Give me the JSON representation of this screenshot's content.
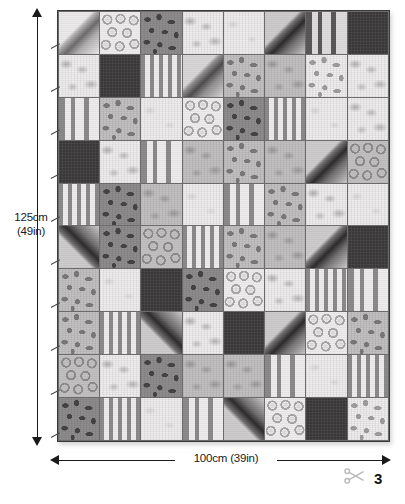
{
  "figure": {
    "page_number": "3",
    "scissors_icon": "scissors-icon"
  },
  "dimensions": {
    "height_label": "125cm",
    "height_label_sub": "(49in)",
    "width_label": "100cm (39in)",
    "vertical_arrow": "double-headed-vertical-arrow",
    "horizontal_arrow": "double-headed-horizontal-arrow"
  },
  "quilt": {
    "columns": 8,
    "rows": 10,
    "patch_total": 80,
    "patterns_legend": [
      "diagonal",
      "circles",
      "spots",
      "plain",
      "stripes",
      "dark",
      "mottle"
    ],
    "colors": {
      "ink": "#1a1a1a",
      "seam": "#585858",
      "border": "#3a3a3a",
      "light": "#f0eeee",
      "mid": "#b5b3b3",
      "dark": "#3b3939",
      "page_bg": "#ffffff"
    },
    "patches": [
      [
        {
          "pattern": "diagonal",
          "tone": "light"
        },
        {
          "pattern": "circles",
          "tone": "light"
        },
        {
          "pattern": "spots",
          "tone": "dark"
        },
        {
          "pattern": "mottle",
          "tone": "light"
        },
        {
          "pattern": "plain",
          "tone": "light"
        },
        {
          "pattern": "diagonal",
          "tone": "dark"
        },
        {
          "pattern": "stripes-wide",
          "tone": "dark"
        },
        {
          "pattern": "dark",
          "tone": "dark"
        }
      ],
      [
        {
          "pattern": "mottle",
          "tone": "light"
        },
        {
          "pattern": "dark",
          "tone": "dark"
        },
        {
          "pattern": "stripes",
          "tone": "mid"
        },
        {
          "pattern": "diagonal",
          "tone": "mid"
        },
        {
          "pattern": "spots",
          "tone": "mid"
        },
        {
          "pattern": "mottle",
          "tone": "mid"
        },
        {
          "pattern": "spots",
          "tone": "light"
        },
        {
          "pattern": "mottle",
          "tone": "light"
        }
      ],
      [
        {
          "pattern": "stripes-wide",
          "tone": "mid"
        },
        {
          "pattern": "spots",
          "tone": "mid"
        },
        {
          "pattern": "plain",
          "tone": "light"
        },
        {
          "pattern": "circles",
          "tone": "light"
        },
        {
          "pattern": "spots",
          "tone": "dark"
        },
        {
          "pattern": "stripes",
          "tone": "mid"
        },
        {
          "pattern": "plain",
          "tone": "light"
        },
        {
          "pattern": "mottle",
          "tone": "light"
        }
      ],
      [
        {
          "pattern": "dark",
          "tone": "dark"
        },
        {
          "pattern": "mottle",
          "tone": "light"
        },
        {
          "pattern": "stripes-wide",
          "tone": "mid"
        },
        {
          "pattern": "mottle",
          "tone": "mid"
        },
        {
          "pattern": "spots",
          "tone": "mid"
        },
        {
          "pattern": "mottle",
          "tone": "mid"
        },
        {
          "pattern": "diagonal",
          "tone": "dark"
        },
        {
          "pattern": "circles",
          "tone": "mid"
        }
      ],
      [
        {
          "pattern": "stripes",
          "tone": "mid"
        },
        {
          "pattern": "spots",
          "tone": "dark"
        },
        {
          "pattern": "mottle",
          "tone": "mid"
        },
        {
          "pattern": "plain",
          "tone": "light"
        },
        {
          "pattern": "stripes-wide",
          "tone": "mid"
        },
        {
          "pattern": "spots",
          "tone": "mid"
        },
        {
          "pattern": "mottle",
          "tone": "light"
        },
        {
          "pattern": "plain",
          "tone": "light"
        }
      ],
      [
        {
          "pattern": "diagonal-rev",
          "tone": "dark"
        },
        {
          "pattern": "spots",
          "tone": "dark"
        },
        {
          "pattern": "circles",
          "tone": "mid"
        },
        {
          "pattern": "stripes",
          "tone": "mid"
        },
        {
          "pattern": "spots",
          "tone": "mid"
        },
        {
          "pattern": "mottle",
          "tone": "mid"
        },
        {
          "pattern": "diagonal",
          "tone": "dark"
        },
        {
          "pattern": "dark",
          "tone": "dark"
        }
      ],
      [
        {
          "pattern": "spots",
          "tone": "mid"
        },
        {
          "pattern": "plain",
          "tone": "light"
        },
        {
          "pattern": "dark",
          "tone": "dark"
        },
        {
          "pattern": "spots",
          "tone": "dark"
        },
        {
          "pattern": "circles",
          "tone": "light"
        },
        {
          "pattern": "mottle",
          "tone": "light"
        },
        {
          "pattern": "stripes",
          "tone": "mid"
        },
        {
          "pattern": "stripes-wide",
          "tone": "mid"
        }
      ],
      [
        {
          "pattern": "spots",
          "tone": "mid"
        },
        {
          "pattern": "stripes",
          "tone": "mid"
        },
        {
          "pattern": "diagonal-rev",
          "tone": "dark"
        },
        {
          "pattern": "mottle",
          "tone": "light"
        },
        {
          "pattern": "dark",
          "tone": "dark"
        },
        {
          "pattern": "diagonal",
          "tone": "dark"
        },
        {
          "pattern": "circles",
          "tone": "light"
        },
        {
          "pattern": "spots",
          "tone": "mid"
        }
      ],
      [
        {
          "pattern": "circles",
          "tone": "mid"
        },
        {
          "pattern": "mottle",
          "tone": "light"
        },
        {
          "pattern": "spots",
          "tone": "dark"
        },
        {
          "pattern": "mottle",
          "tone": "mid"
        },
        {
          "pattern": "mottle",
          "tone": "mid"
        },
        {
          "pattern": "stripes-wide",
          "tone": "mid"
        },
        {
          "pattern": "plain",
          "tone": "light"
        },
        {
          "pattern": "stripes",
          "tone": "mid"
        }
      ],
      [
        {
          "pattern": "spots",
          "tone": "dark"
        },
        {
          "pattern": "stripes",
          "tone": "mid"
        },
        {
          "pattern": "plain",
          "tone": "light"
        },
        {
          "pattern": "stripes-wide",
          "tone": "mid"
        },
        {
          "pattern": "diagonal-rev",
          "tone": "dark"
        },
        {
          "pattern": "circles",
          "tone": "light"
        },
        {
          "pattern": "dark",
          "tone": "dark"
        },
        {
          "pattern": "spots",
          "tone": "light"
        }
      ]
    ]
  }
}
